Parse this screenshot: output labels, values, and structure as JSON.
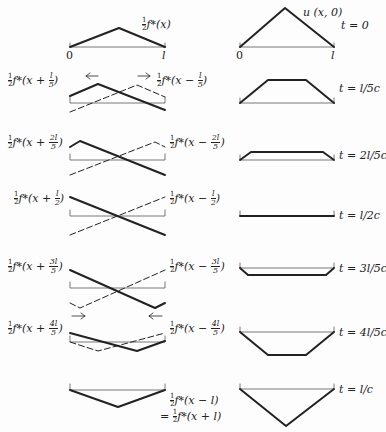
{
  "figure": {
    "left_column_title": "Components of the solution",
    "right_column_title": "Resulting displacement"
  },
  "axis": {
    "origin": "0",
    "end": "l"
  },
  "rows": [
    {
      "time": "t = 0",
      "left_label": "f*(x)",
      "left_label_prefix": "½",
      "right_label": "u (x, 0)"
    },
    {
      "time": "t = l/5c",
      "left_plus": {
        "coef": "1",
        "frac_num": "l",
        "frac_den": "5",
        "text": "f*(x + ",
        "close": ")"
      },
      "left_minus": {
        "frac_num": "l",
        "frac_den": "5",
        "text": "f*(x − ",
        "close": ")"
      },
      "arrows": [
        "←",
        "→"
      ]
    },
    {
      "time": "t = 2l/5c",
      "left_plus": {
        "frac_num": "2l",
        "frac_den": "5",
        "text": "f*(x + ",
        "close": ")"
      },
      "left_minus": {
        "frac_num": "2l",
        "frac_den": "5",
        "text": "f*(x − ",
        "close": ")"
      }
    },
    {
      "time": "t = l/2c",
      "left_plus": {
        "frac_num": "l",
        "frac_den": "2",
        "text": "f*(x + ",
        "close": ")"
      },
      "left_minus": {
        "frac_num": "l",
        "frac_den": "2",
        "text": "f*(x − ",
        "close": ")"
      }
    },
    {
      "time": "t = 3l/5c",
      "left_plus": {
        "frac_num": "3l",
        "frac_den": "5",
        "text": "f*(x + ",
        "close": ")"
      },
      "left_minus": {
        "frac_num": "3l",
        "frac_den": "5",
        "text": "f*(x − ",
        "close": ")"
      },
      "arrows": [
        "→",
        "←"
      ]
    },
    {
      "time": "t = 4l/5c",
      "left_plus": {
        "frac_num": "4l",
        "frac_den": "5",
        "text": "f*(x + ",
        "close": ")"
      },
      "left_minus": {
        "frac_num": "4l",
        "frac_den": "5",
        "text": "f*(x − ",
        "close": ")"
      }
    },
    {
      "time": "t = l/c",
      "final_line1": "f*(x − l)",
      "final_line2_prefix": "=",
      "final_line2": "f*(x + l)"
    }
  ],
  "half": {
    "num": "1",
    "den": "2"
  },
  "colors": {
    "ink": "#222222",
    "baseline": "#555555",
    "background": "#fdfdfd"
  }
}
